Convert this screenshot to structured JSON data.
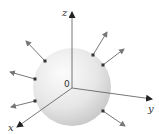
{
  "diagram": {
    "labels": {
      "z_axis": "z",
      "y_axis": "y",
      "x_axis": "x",
      "origin": "0"
    },
    "colors": {
      "sphere_light": "#fafafa",
      "sphere_dark": "#c8c8c8",
      "axis": "#555555",
      "arrow": "#777777",
      "point": "#333333"
    },
    "sphere": {
      "cx": 72,
      "cy": 87,
      "r": 39
    },
    "origin": {
      "x": 72,
      "y": 88
    },
    "axes": [
      {
        "name": "z",
        "end": [
          72,
          12
        ]
      },
      {
        "name": "y",
        "end": [
          152,
          99
        ]
      },
      {
        "name": "x",
        "end": [
          17,
          127
        ]
      }
    ],
    "normal_vectors": [
      {
        "from": [
          45,
          61
        ],
        "to": [
          26,
          41
        ]
      },
      {
        "from": [
          35,
          79
        ],
        "to": [
          10,
          72
        ]
      },
      {
        "from": [
          35,
          101
        ],
        "to": [
          11,
          107
        ]
      },
      {
        "from": [
          93,
          55
        ],
        "to": [
          107,
          32
        ]
      },
      {
        "from": [
          103,
          65
        ],
        "to": [
          124,
          49
        ]
      },
      {
        "from": [
          103,
          111
        ],
        "to": [
          125,
          126
        ]
      }
    ]
  }
}
